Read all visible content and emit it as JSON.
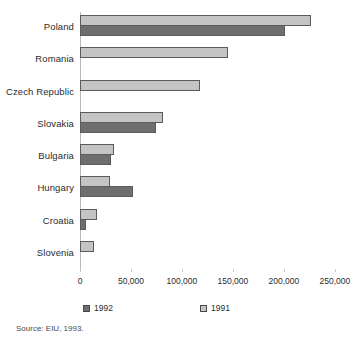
{
  "chart_data": {
    "type": "bar",
    "orientation": "horizontal",
    "title": "",
    "xlabel": "",
    "ylabel": "",
    "xlim": [
      0,
      257000
    ],
    "grid": false,
    "legend_position": "bottom",
    "categories": [
      "Poland",
      "Romania",
      "Czech Republic",
      "Slovakia",
      "Bulgaria",
      "Hungary",
      "Croatia",
      "Slovenia"
    ],
    "tick_labels": [
      "0",
      "50,000",
      "100,000",
      "150,000",
      "200,000",
      "250,000"
    ],
    "tick_values": [
      0,
      50000,
      100000,
      150000,
      200000,
      250000
    ],
    "series": [
      {
        "name": "1991",
        "color": "#c4c4c4",
        "values": [
          227000,
          145000,
          118000,
          81000,
          33000,
          29000,
          17000,
          14000
        ]
      },
      {
        "name": "1992",
        "color": "#6e6e6e",
        "values": [
          201000,
          0,
          0,
          75000,
          30000,
          52000,
          6000,
          0
        ]
      }
    ],
    "source": "Source: EIU, 1993."
  },
  "legend": {
    "items": [
      {
        "label": "1992",
        "swatch": "dark-square-swatch"
      },
      {
        "label": "1991",
        "swatch": "light-square-swatch"
      }
    ]
  },
  "footer": {
    "source": "Source: EIU, 1993."
  }
}
